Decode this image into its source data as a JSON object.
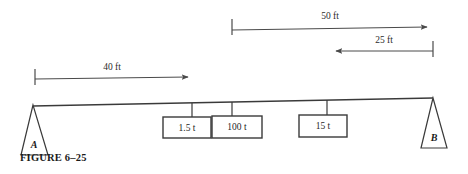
{
  "figure": {
    "caption": "FIGURE 6–25"
  },
  "colors": {
    "line": "#3a3a3a",
    "dimension": "#4a4a4a",
    "text": "#1a1a1a",
    "background": "#ffffff"
  },
  "beam": {
    "left_end_label": "A",
    "right_end_label": "B"
  },
  "supports": [
    {
      "name": "support-a",
      "label": "A",
      "type": "triangle"
    },
    {
      "name": "support-b",
      "label": "B",
      "type": "triangle"
    }
  ],
  "loads": [
    {
      "name": "load-1",
      "label": "1.5 t",
      "value": 1.5,
      "unit": "t"
    },
    {
      "name": "load-2",
      "label": "100 t",
      "value": 100,
      "unit": "t"
    },
    {
      "name": "load-3",
      "label": "15 t",
      "value": 15,
      "unit": "t"
    }
  ],
  "dimensions": [
    {
      "name": "dimension-40ft",
      "label": "40 ft",
      "value": 40,
      "unit": "ft",
      "direction": "right"
    },
    {
      "name": "dimension-50ft",
      "label": "50 ft",
      "value": 50,
      "unit": "ft",
      "direction": "right"
    },
    {
      "name": "dimension-25ft",
      "label": "25 ft",
      "value": 25,
      "unit": "ft",
      "direction": "left"
    }
  ]
}
